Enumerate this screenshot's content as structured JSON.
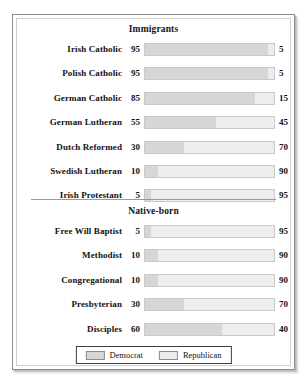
{
  "chart_data": {
    "type": "bar",
    "title": "",
    "orientation": "horizontal",
    "stacked": true,
    "xlim": [
      0,
      100
    ],
    "grid": false,
    "legend": {
      "position": "bottom-center",
      "entries": [
        {
          "name": "Democrat",
          "color": "#d6d6d6"
        },
        {
          "name": "Republican",
          "color": "#ededed"
        }
      ]
    },
    "series": [
      {
        "name": "Democrat",
        "color": "#d6d6d6"
      },
      {
        "name": "Republican",
        "color": "#ededed"
      }
    ],
    "panels": [
      {
        "title": "Immigrants",
        "categories": [
          "Irish Catholic",
          "Polish Catholic",
          "German Catholic",
          "German Lutheran",
          "Dutch Reformed",
          "Swedish Lutheran",
          "Irish Protestant"
        ],
        "democrat": [
          95,
          95,
          85,
          55,
          30,
          10,
          5
        ],
        "republican": [
          5,
          5,
          15,
          45,
          70,
          90,
          95
        ]
      },
      {
        "title": "Native-born",
        "categories": [
          "Free Will Baptist",
          "Methodist",
          "Congregational",
          "Presbyterian",
          "Disciples"
        ],
        "democrat": [
          5,
          10,
          10,
          30,
          60
        ],
        "republican": [
          95,
          90,
          90,
          70,
          40
        ]
      }
    ]
  }
}
